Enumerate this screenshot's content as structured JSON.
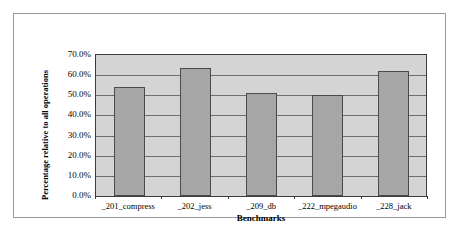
{
  "chart_data": {
    "type": "bar",
    "title": "",
    "categories": [
      "_201_compress",
      "_202_jess",
      "_209_db",
      "_222_mpegaudio",
      "_228_jack"
    ],
    "values": [
      54.0,
      63.5,
      51.0,
      50.0,
      62.0
    ],
    "series": [
      {
        "name": "Percentage relative to all operations",
        "values": [
          54.0,
          63.5,
          51.0,
          50.0,
          62.0
        ]
      }
    ],
    "xlabel": "Benchmarks",
    "ylabel": "Percentage relative to all operations",
    "ylim": [
      0,
      70
    ],
    "ytick_labels": [
      "70.0%",
      "60.0%",
      "50.0%",
      "40.0%",
      "30.0%",
      "20.0%",
      "10.0%",
      "0.0%"
    ],
    "ytick_values": [
      70,
      60,
      50,
      40,
      30,
      20,
      10,
      0
    ],
    "grid": true,
    "grid_axis": "y",
    "legend": false,
    "legend_position": "none",
    "colors": {
      "bar_fill": "#a6a6a6",
      "bar_border": "#4a4a4a",
      "plot_background": "#d4d4d4",
      "gridline": "#6e6e6e",
      "axis": "#3c3c3c",
      "frame_border": "#9a9a9a",
      "figure_background": "#ffffff",
      "text": "#000000"
    }
  }
}
